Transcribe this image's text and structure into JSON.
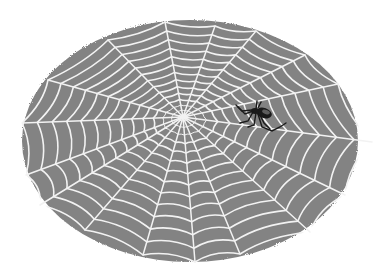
{
  "image": {
    "subject": "spider web illustration with spider",
    "background_color": "#ffffff",
    "web_backdrop_color": "#838383",
    "silk_color": "#f2f2f2",
    "spider_color": "#1a1a1a"
  },
  "web": {
    "ellipse": {
      "cx": 190,
      "cy": 141,
      "rx": 168,
      "ry": 121
    },
    "hub": {
      "x": 183,
      "y": 117
    },
    "spokes": [
      [
        165,
        22
      ],
      [
        215,
        26
      ],
      [
        256,
        31
      ],
      [
        305,
        55
      ],
      [
        338,
        84
      ],
      [
        372,
        142
      ],
      [
        345,
        195
      ],
      [
        310,
        232
      ],
      [
        240,
        254
      ],
      [
        195,
        262
      ],
      [
        143,
        255
      ],
      [
        85,
        230
      ],
      [
        40,
        205
      ],
      [
        26,
        175
      ],
      [
        22,
        123
      ],
      [
        48,
        80
      ],
      [
        108,
        40
      ]
    ],
    "ring_count": 14
  },
  "spider": {
    "x": 258,
    "y": 117,
    "label": "spider"
  }
}
